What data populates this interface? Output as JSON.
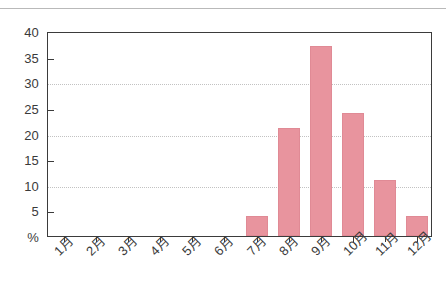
{
  "chart_data": {
    "type": "bar",
    "title": "",
    "subtitle": "",
    "xlabel": "",
    "ylabel": "%",
    "categories": [
      "1月",
      "2月",
      "3月",
      "4月",
      "5月",
      "6月",
      "7月",
      "8月",
      "9月",
      "10月",
      "11月",
      "12月"
    ],
    "values": [
      0,
      0,
      0,
      0,
      0,
      0,
      4,
      21,
      37,
      24,
      11,
      4
    ],
    "series": [
      {
        "name": "",
        "values": [
          0,
          0,
          0,
          0,
          0,
          0,
          4,
          21,
          37,
          24,
          11,
          4
        ]
      }
    ],
    "ylim": [
      0,
      40
    ],
    "ytick_labels": [
      "40",
      "35",
      "30",
      "25",
      "20",
      "15",
      "10",
      "5",
      "%"
    ],
    "ytick_values": [
      40,
      35,
      30,
      25,
      20,
      15,
      10,
      5,
      0
    ],
    "gridlines_at": [
      30,
      20,
      10
    ],
    "grid": true,
    "legend": "none",
    "bar_color": "#e8949e",
    "axis_color": "#3b3b3b",
    "grid_color": "#c2c2c2"
  }
}
